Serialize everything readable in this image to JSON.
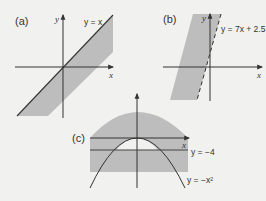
{
  "figure": {
    "background": "#f1f1ef",
    "shade_color": "#bdbdbd",
    "line_color": "#333333",
    "panels": [
      {
        "id": "a",
        "label": "(a)",
        "x_axis_label": "x",
        "y_axis_label": "y",
        "boundary_equation": "y = x",
        "boundary_style": "solid"
      },
      {
        "id": "b",
        "label": "(b)",
        "x_axis_label": "x",
        "y_axis_label": "y",
        "boundary_equation": "y = 7x + 2.5",
        "boundary_style": "dashed"
      },
      {
        "id": "c",
        "label": "(c)",
        "x_axis_label": "x",
        "y_axis_label": "",
        "boundary_equations": [
          "y = −4",
          "y = −x²"
        ],
        "boundary_style": "solid"
      }
    ]
  }
}
